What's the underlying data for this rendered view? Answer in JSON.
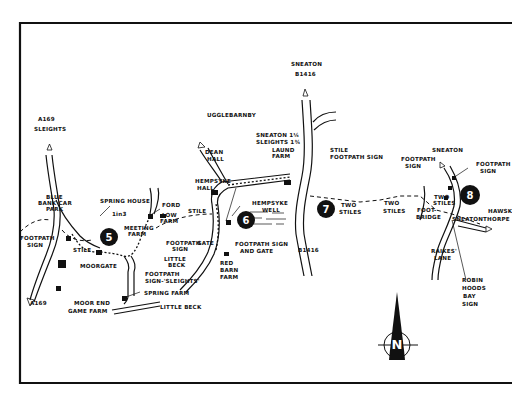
{
  "map": {
    "labels": {
      "a169_north": "A169",
      "sleights": "SLEIGHTS",
      "blue_bank_car_park": [
        "BLUE",
        "BANK CAR",
        "PARK"
      ],
      "footpath_sign_west": [
        "FOOTPATH",
        "SIGN"
      ],
      "stile_west": "STILE",
      "spring_house": "SPRING HOUSE",
      "in3": "1in3",
      "meeting_farm": [
        "MEETING",
        "FARM"
      ],
      "moorgate": "MOORGATE",
      "a169_south": "A169",
      "moor_end_game_farm": [
        "MOOR END",
        "GAME FARM"
      ],
      "ford": "FORD",
      "low_farm": [
        "LOW",
        "FARM"
      ],
      "stile_mid": "STILE",
      "footpath_sign_low": [
        "FOOTPATH",
        "SIGN"
      ],
      "gate": "GATE",
      "little_beck_stream": [
        "LITTLE",
        "BECK"
      ],
      "footpath_sign_sleights": [
        "FOOTPATH",
        "SIGN-'SLEIGHTS'"
      ],
      "spring_farm": "SPRING FARM",
      "little_beck": "LITTLE BECK",
      "ugglebarnby": "UGGLEBARNBY",
      "dean_hall": [
        "DEAN",
        "HALL"
      ],
      "hempsyke_hall": [
        "HEMPSYKE",
        "HALL"
      ],
      "hempsyke_well": [
        "HEMPSYKE",
        "WELL"
      ],
      "footpath_sign_and_gate": [
        "FOOTPATH SIGN",
        "AND GATE"
      ],
      "red_barn_farm": [
        "RED",
        "BARN",
        "FARM"
      ],
      "sneaton_sleights_distance": [
        "SNEATON 1¼",
        "SLEIGHTS 1¾"
      ],
      "laund_farm": [
        "LAUND",
        "FARM"
      ],
      "sneaton_b1416": [
        "SNEATON",
        "B1416"
      ],
      "stile_footpath_sign": [
        "STILE",
        "FOOTPATH SIGN"
      ],
      "b1416_south": "B1416",
      "two_stiles_1": [
        "TWO",
        "STILES"
      ],
      "two_stiles_2": [
        "TWO",
        "STILES"
      ],
      "footpath_sign_east": [
        "FOOTPATH",
        "SIGN"
      ],
      "footbridge": [
        "FOOT-",
        "BRIDGE"
      ],
      "two_stiles_3": [
        "TWO",
        "STILES"
      ],
      "sneaton": "SNEATON",
      "footpath_sign_8": [
        "FOOTPATH",
        "SIGN"
      ],
      "hawsker": "HAWSK",
      "sneatonthorpe": "SNEATONTHORPE",
      "raikes_lane": [
        "RAIKES'",
        "LANE"
      ],
      "robin_hoods_bay_sign": [
        "ROBIN",
        "HOODS",
        "BAY",
        "SIGN"
      ]
    },
    "waypoints": [
      "5",
      "6",
      "7",
      "8"
    ],
    "compass": {
      "letter": "N"
    },
    "colors": {
      "ink": "#111111",
      "paper": "#ffffff"
    }
  }
}
